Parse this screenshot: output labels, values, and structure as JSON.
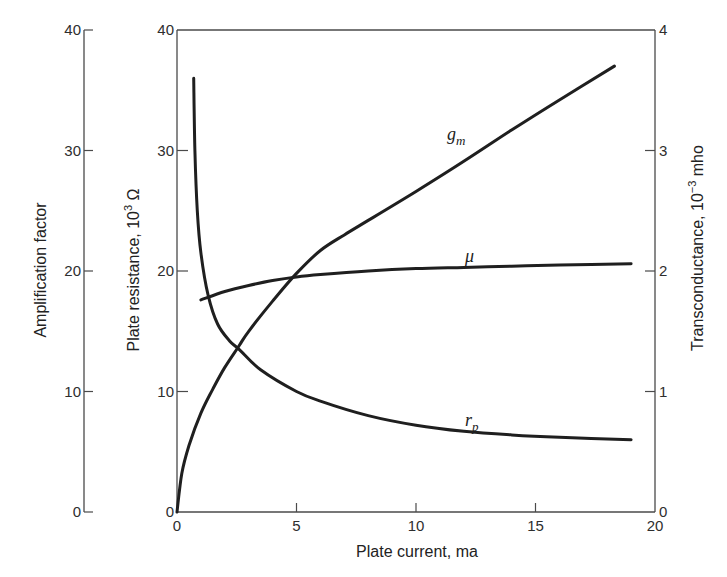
{
  "chart_data": {
    "type": "line",
    "title": "",
    "xlabel": "Plate current, ma",
    "xlim": [
      0,
      20
    ],
    "x_ticks": [
      0,
      5,
      10,
      15,
      20
    ],
    "grid": false,
    "legend": "none (curves labeled inline)",
    "axes": {
      "left_outer": {
        "label": "Amplification factor",
        "range": [
          0,
          40
        ],
        "ticks": [
          0,
          10,
          20,
          30,
          40
        ],
        "applies_to": "mu"
      },
      "left_inner": {
        "label": "Plate resistance, 10^3 Ω",
        "label_main": "Plate resistance, 10",
        "label_sup": "3",
        "label_unit": " Ω",
        "range": [
          0,
          40
        ],
        "ticks": [
          0,
          10,
          20,
          30,
          40
        ],
        "applies_to": "r_p"
      },
      "right": {
        "label": "Transconductance, 10^-3 mho",
        "label_main": "Transconductance, 10",
        "label_sup": "−3",
        "label_unit": " mho",
        "range": [
          0,
          4
        ],
        "ticks": [
          0,
          1,
          2,
          3,
          4
        ],
        "applies_to": "g_m"
      }
    },
    "series": [
      {
        "name": "g_m",
        "label_main": "g",
        "label_sub": "m",
        "axis": "right",
        "x": [
          0,
          0.2,
          0.5,
          1,
          1.5,
          2,
          2.6,
          3,
          4,
          5,
          6,
          7,
          8,
          10,
          12,
          14,
          16,
          18.3
        ],
        "y": [
          0,
          0.32,
          0.55,
          0.82,
          1.02,
          1.2,
          1.38,
          1.5,
          1.75,
          1.98,
          2.17,
          2.3,
          2.42,
          2.66,
          2.91,
          3.17,
          3.42,
          3.7
        ]
      },
      {
        "name": "mu",
        "label_main": "μ",
        "axis": "left_outer",
        "x": [
          1,
          2,
          3,
          4,
          5,
          6,
          8,
          10,
          12,
          14,
          16,
          19
        ],
        "y": [
          17.6,
          18.3,
          18.8,
          19.2,
          19.5,
          19.7,
          20.0,
          20.2,
          20.3,
          20.4,
          20.5,
          20.6
        ]
      },
      {
        "name": "r_p",
        "label_main": "r",
        "label_sub": "p",
        "axis": "left_inner",
        "x": [
          0.7,
          0.75,
          0.85,
          1.0,
          1.3,
          1.7,
          2.2,
          2.6,
          3.5,
          5,
          6,
          8,
          10,
          12,
          14,
          16,
          19
        ],
        "y": [
          36,
          30,
          25,
          21.5,
          18,
          15.6,
          14.2,
          13.5,
          11.8,
          10,
          9.2,
          8.0,
          7.2,
          6.7,
          6.4,
          6.2,
          6.0
        ]
      }
    ]
  },
  "labels": {
    "x_title": "Plate current, ma",
    "left_outer_title": "Amplification factor",
    "left_inner_title_main": "Plate resistance, 10",
    "left_inner_title_sup": "3",
    "left_inner_title_unit": " Ω",
    "right_title_main": "Transconductance, 10",
    "right_title_sup": "−3",
    "right_title_unit": " mho",
    "gm_main": "g",
    "gm_sub": "m",
    "mu": "μ",
    "rp_main": "r",
    "rp_sub": "p"
  }
}
